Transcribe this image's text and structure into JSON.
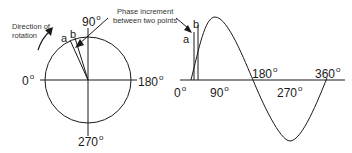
{
  "circle_diagram": {
    "angle_labels": {
      "deg0": "0",
      "deg90": "90",
      "deg180": "180",
      "deg270": "270",
      "degree_symbol": "o"
    },
    "rotation_label": [
      "Direction of",
      "rotation"
    ],
    "point_a": "a",
    "point_b": "b"
  },
  "annotation": {
    "phase_increment": [
      "Phase increment",
      "between two points"
    ]
  },
  "sine_diagram": {
    "axis_labels": {
      "deg0": "0",
      "deg90": "90",
      "deg180": "180",
      "deg270": "270",
      "deg360": "360",
      "degree_symbol": "o"
    },
    "point_a": "a",
    "point_b": "b"
  },
  "colors": {
    "line": "#1a1a1a",
    "background": "#ffffff"
  }
}
